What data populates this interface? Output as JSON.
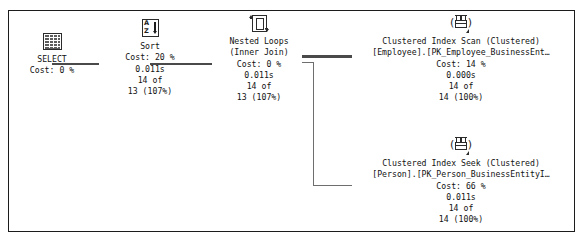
{
  "diagram": {
    "kind": "sql-server-execution-plan",
    "frame_border_color": "#1c1c1c",
    "text_color": "#121212",
    "connector_color": "#4a4a4a"
  },
  "nodes": [
    {
      "id": "select",
      "icon": "result-grid-icon",
      "lines": [
        "SELECT",
        "Cost: 0 %"
      ]
    },
    {
      "id": "sort",
      "icon": "sort-az-icon",
      "lines": [
        "Sort",
        "Cost: 20 %",
        "0.011s",
        "14 of",
        "13 (107%)"
      ]
    },
    {
      "id": "nested-loops",
      "icon": "nested-loops-icon",
      "lines": [
        "Nested Loops",
        "(Inner Join)",
        "Cost: 0 %",
        "0.011s",
        "14 of",
        "13 (107%)"
      ]
    },
    {
      "id": "clustered-index-scan",
      "icon": "clustered-index-scan-icon",
      "lines": [
        "Clustered Index Scan (Clustered)",
        "[Employee].[PK_Employee_BusinessEnt…",
        "Cost: 14 %",
        "0.000s",
        "14 of",
        "14 (100%)"
      ]
    },
    {
      "id": "clustered-index-seek",
      "icon": "clustered-index-seek-icon",
      "lines": [
        "Clustered Index Seek (Clustered)",
        "[Person].[PK_Person_BusinessEntityI…",
        "Cost: 66 %",
        "0.011s",
        "14 of",
        "14 (100%)"
      ]
    }
  ],
  "select_node": {
    "label": "SELECT",
    "cost": "Cost: 0 %"
  },
  "sort_node": {
    "label": "Sort",
    "cost": "Cost: 20 %",
    "time": "0.011s",
    "rows_actual": "14 of",
    "rows_estimated": "13 (107%)"
  },
  "nested_loops_node": {
    "label": "Nested Loops",
    "join_type": "(Inner Join)",
    "cost": "Cost: 0 %",
    "time": "0.011s",
    "rows_actual": "14 of",
    "rows_estimated": "13 (107%)"
  },
  "index_scan_node": {
    "label": "Clustered Index Scan (Clustered)",
    "object": "[Employee].[PK_Employee_BusinessEnt…",
    "cost": "Cost: 14 %",
    "time": "0.000s",
    "rows_actual": "14 of",
    "rows_estimated": "14 (100%)"
  },
  "index_seek_node": {
    "label": "Clustered Index Seek (Clustered)",
    "object": "[Person].[PK_Person_BusinessEntityI…",
    "cost": "Cost: 66 %",
    "time": "0.011s",
    "rows_actual": "14 of",
    "rows_estimated": "14 (100%)"
  },
  "sort_icon": {
    "top_letter": "A",
    "bottom_letter": "Z"
  }
}
